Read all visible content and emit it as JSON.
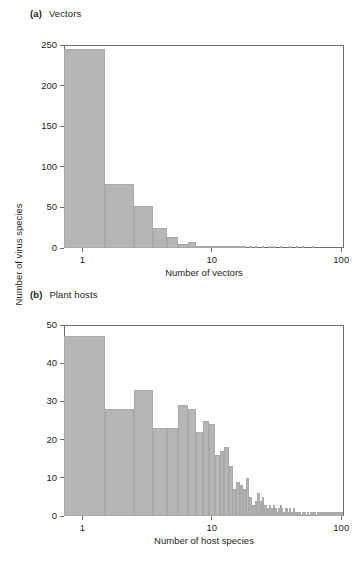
{
  "figure": {
    "shared_ylabel": "Number of virus species",
    "bar_color": "#b6b6b6",
    "axis_color": "#6f6f6f",
    "panels": [
      {
        "tag": "(a)",
        "title": "Vectors"
      },
      {
        "tag": "(b)",
        "title": "Plant hosts"
      }
    ]
  },
  "chart_data": [
    {
      "type": "bar",
      "panel": "a",
      "title": "Vectors",
      "panel_tag": "(a)",
      "xlabel": "Number of vectors",
      "ylabel": "Number of virus species",
      "xscale": "log",
      "xlim": [
        0.72,
        105
      ],
      "ylim": [
        0,
        250
      ],
      "yticks": [
        0,
        50,
        100,
        150,
        200,
        250
      ],
      "xticks": [
        1,
        10,
        100
      ],
      "xticklabels": [
        "1",
        "10",
        "100"
      ],
      "grid": false,
      "legend": "none",
      "x": [
        1,
        2,
        3,
        4,
        5,
        6,
        7,
        8,
        9,
        10,
        11,
        12,
        13,
        14,
        15,
        16,
        17,
        18,
        20,
        22,
        25,
        28,
        30,
        34,
        40,
        45,
        50,
        60
      ],
      "values": [
        245,
        79,
        52,
        25,
        14,
        5,
        7,
        2,
        2,
        3,
        1,
        1,
        1,
        1,
        1,
        1,
        1,
        1,
        1,
        1,
        1,
        1,
        1,
        1,
        1,
        1,
        1,
        1
      ]
    },
    {
      "type": "bar",
      "panel": "b",
      "title": "Plant hosts",
      "panel_tag": "(b)",
      "xlabel": "Number of host species",
      "ylabel": "Number of virus species",
      "xscale": "log",
      "xlim": [
        0.72,
        105
      ],
      "ylim": [
        0,
        50
      ],
      "yticks": [
        0,
        10,
        20,
        30,
        40,
        50
      ],
      "xticks": [
        1,
        10,
        100
      ],
      "xticklabels": [
        "1",
        "10",
        "100"
      ],
      "grid": false,
      "legend": "none",
      "x": [
        1,
        2,
        3,
        4,
        5,
        6,
        7,
        8,
        9,
        10,
        11,
        12,
        13,
        14,
        15,
        16,
        17,
        18,
        19,
        20,
        21,
        22,
        23,
        24,
        25,
        26,
        27,
        28,
        29,
        30,
        31,
        32,
        33,
        34,
        35,
        36,
        37,
        38,
        39,
        40,
        41,
        42,
        43,
        44,
        45,
        46,
        47,
        48,
        50,
        52,
        55,
        58,
        60,
        62,
        65,
        68,
        70,
        73,
        75,
        78,
        80,
        83,
        85,
        88,
        90,
        93,
        95,
        98,
        100
      ],
      "values": [
        47,
        28,
        33,
        23,
        23,
        29,
        28,
        22,
        25,
        24,
        16,
        17,
        18,
        13,
        7,
        9,
        8,
        7,
        10,
        5,
        3,
        4,
        6,
        4,
        5,
        3,
        2,
        3,
        2,
        3,
        2,
        1,
        2,
        3,
        2,
        1,
        2,
        2,
        1,
        2,
        1,
        1,
        2,
        1,
        1,
        1,
        1,
        1,
        1,
        1,
        1,
        1,
        1,
        1,
        1,
        1,
        1,
        1,
        1,
        1,
        1,
        1,
        1,
        1,
        1,
        1,
        1,
        1,
        1
      ]
    }
  ]
}
